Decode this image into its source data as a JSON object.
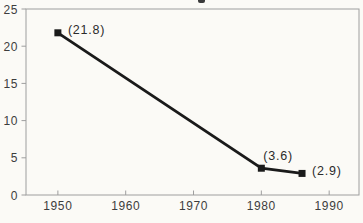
{
  "chart_data": {
    "type": "line",
    "title": "",
    "xlabel": "",
    "ylabel": "",
    "series": [
      {
        "name": "value-over-time",
        "points": [
          {
            "x": 1950,
            "y": 21.8,
            "label": "(21.8)",
            "label_dx": 10,
            "label_dy": 1
          },
          {
            "x": 1980,
            "y": 3.6,
            "label": "(3.6)",
            "label_dx": 2,
            "label_dy": -8
          },
          {
            "x": 1986,
            "y": 2.9,
            "label": "(2.9)",
            "label_dx": 10,
            "label_dy": 2
          }
        ]
      }
    ],
    "xticks": [
      1950,
      1960,
      1970,
      1980,
      1990
    ],
    "yticks": [
      0,
      5,
      10,
      15,
      20,
      25
    ],
    "xlim": [
      1945.3,
      1994.4
    ],
    "ylim": [
      0,
      25
    ],
    "grid": false,
    "legend": null,
    "colors": {
      "line": "#1a1a1a",
      "marker": "#1a1a1a",
      "frame": "#9e9e9e",
      "text": "#3d3d3d",
      "background": "#fbfaf6"
    }
  },
  "artifacts": {
    "cropped_title_fragment": "descender of a chart title cut off by the crop"
  }
}
